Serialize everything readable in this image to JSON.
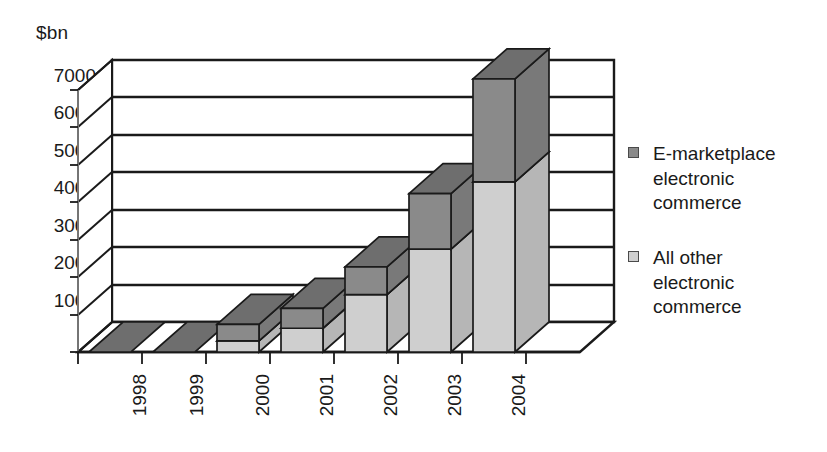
{
  "chart_data": {
    "type": "bar",
    "subtype": "stacked-3d-column",
    "title": "",
    "subtitle": "",
    "xlabel": "",
    "ylabel": "$bn",
    "unit_label": "$bn",
    "categories": [
      "1998",
      "1999",
      "2000",
      "2001",
      "2002",
      "2003",
      "2004"
    ],
    "series": [
      {
        "name": "All other electronic commerce",
        "legend_label": "All other\nelectronic\ncommerce",
        "color": "#cfcfcf",
        "values": [
          0,
          0,
          280,
          600,
          1450,
          2600,
          4300
        ]
      },
      {
        "name": "E-marketplace electronic commerce",
        "legend_label": "E-marketplace\nelectronic\ncommerce",
        "color": "#8a8a8a",
        "values": [
          0,
          0,
          420,
          500,
          700,
          1400,
          2600
        ]
      }
    ],
    "totals": [
      0,
      0,
      700,
      1100,
      2150,
      4000,
      6900
    ],
    "ylim": [
      0,
      7000
    ],
    "ytick_values": [
      0,
      1000,
      2000,
      3000,
      4000,
      5000,
      6000,
      7000
    ],
    "ytick_labels": [
      "0",
      "1000",
      "2000",
      "3000",
      "4000",
      "5000",
      "6000",
      "7000"
    ],
    "grid": true,
    "grid_axis": "y",
    "legend_position": "right",
    "colors": {
      "emarketplace": "#8a8a8a",
      "all_other": "#cfcfcf",
      "axis": "#1a1a1a",
      "grid": "#1a1a1a",
      "background": "#ffffff",
      "floor": "#ffffff"
    }
  },
  "legend": {
    "entries": [
      {
        "label": "E-marketplace\nelectronic\ncommerce",
        "swatch": "#8a8a8a",
        "swatch_name": "legend-swatch-emarketplace"
      },
      {
        "label": "All other\nelectronic\ncommerce",
        "swatch": "#cfcfcf",
        "swatch_name": "legend-swatch-all-other"
      }
    ]
  },
  "axis": {
    "unit": "$bn",
    "y_labels": [
      "7000",
      "6000",
      "5000",
      "4000",
      "3000",
      "2000",
      "1000",
      "0"
    ],
    "x_labels": [
      "1998",
      "1999",
      "2000",
      "2001",
      "2002",
      "2003",
      "2004"
    ]
  }
}
